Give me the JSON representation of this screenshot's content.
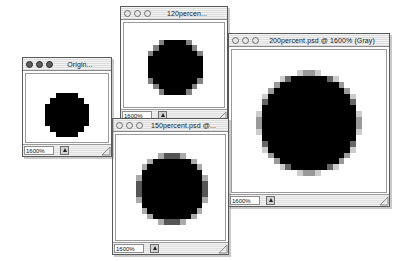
{
  "app": {
    "name": "Adobe Photoshop",
    "platform": "Mac OS",
    "background_color": "#ffffff"
  },
  "windows": [
    {
      "id": "original",
      "title": "Origin...",
      "title_full": "Original",
      "active": true,
      "zoom_field": "1600%",
      "size_box_icon": "resize-grip-icon",
      "buttons": [
        "close-button",
        "minimize-button",
        "zoom-button"
      ],
      "image": {
        "alt_name": "pixelated-circle-aliased",
        "description": "Hard-edged aliased black circle, 1-bit, no gray levels",
        "grid": 10,
        "levels": 2
      }
    },
    {
      "id": "120percent",
      "title": "120percen...",
      "title_full": "120percent.psd @ 1600% (Gray)",
      "active": false,
      "zoom_field": "1600%",
      "size_box_icon": "resize-grip-icon",
      "buttons": [
        "close-button",
        "minimize-button",
        "zoom-button"
      ],
      "image": {
        "alt_name": "pixelated-circle-light-antialias",
        "description": "Black circle with a single mid-gray anti-aliased edge ring",
        "grid": 12,
        "levels": 3
      }
    },
    {
      "id": "150percent",
      "title": "150percent.psd @...",
      "title_full": "150percent.psd @ 1600% (Gray)",
      "active": false,
      "zoom_field": "1600%",
      "size_box_icon": "resize-grip-icon",
      "buttons": [
        "close-button",
        "minimize-button",
        "zoom-button"
      ],
      "image": {
        "alt_name": "pixelated-circle-medium-antialias",
        "description": "Black circle with two-step gray anti-aliased edge",
        "grid": 15,
        "levels": 4
      }
    },
    {
      "id": "200percent",
      "title": "200percent.psd @ 1600% (Gray)",
      "title_full": "200percent.psd @ 1600% (Gray)",
      "active": false,
      "zoom_field": "1600%",
      "size_box_icon": "resize-grip-icon",
      "buttons": [
        "close-button",
        "minimize-button",
        "zoom-button"
      ],
      "image": {
        "alt_name": "pixelated-circle-heavy-antialias",
        "description": "Black circle with smooth multi-level gray anti-aliased edge",
        "grid": 20,
        "levels": 6
      }
    }
  ]
}
